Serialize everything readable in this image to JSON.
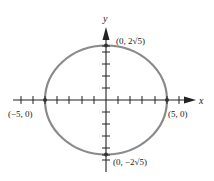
{
  "diagram": {
    "title": "",
    "x_axis_label": "x",
    "y_axis_label": "y",
    "curve": "ellipse",
    "ellipse_color": "#8a8a8a",
    "axis_color": "#222222",
    "points": [
      {
        "label": "(0, 2√5)",
        "x": 0,
        "y": 4.47
      },
      {
        "label": "(−5, 0)",
        "x": -5,
        "y": 0
      },
      {
        "label": "(5, 0)",
        "x": 5,
        "y": 0
      },
      {
        "label": "(0, −2√5)",
        "x": 0,
        "y": -4.47
      }
    ]
  }
}
